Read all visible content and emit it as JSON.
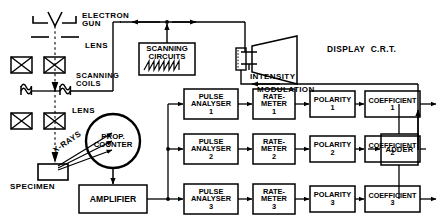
{
  "diagram": {
    "column_labels": {
      "electron_gun": "ELECTRON\nGUN",
      "lens_top": "LENS",
      "scanning_coils": "SCANNING\nCOILS",
      "lens_bottom": "LENS",
      "x_rays": "X-RAYS",
      "specimen": "SPECIMEN",
      "prop_counter": "PROP.\nCOUNTER",
      "display_crt": "DISPLAY  C.R.T.",
      "intensity": "INTENSITY",
      "modulation": "MODULATION"
    },
    "boxes": {
      "scanning_circuits": "SCANNING\nCIRCUITS",
      "amplifier": "AMPLIFIER",
      "adder": "ADDER"
    },
    "chain_headers": [
      "PULSE\nANALYSER",
      "RATE-\nMETER",
      "POLARITY",
      "COEFFICIENT"
    ],
    "channels": [
      {
        "index": "1",
        "pulse_analyser": "PULSE\nANALYSER",
        "pulse_analyser_num": "1",
        "rate_meter": "RATE-\nMETER",
        "rate_meter_num": "1",
        "polarity": "POLARITY",
        "polarity_num": "1",
        "coefficient": "COEFFICIENT",
        "coefficient_num": "1"
      },
      {
        "index": "2",
        "pulse_analyser": "PULSE\nANALYSER",
        "pulse_analyser_num": "2",
        "rate_meter": "RATE-\nMETER",
        "rate_meter_num": "2",
        "polarity": "POLARITY",
        "polarity_num": "2",
        "coefficient": "COEFFICIENT",
        "coefficient_num": "2"
      },
      {
        "index": "3",
        "pulse_analyser": "PULSE\nANALYSER",
        "pulse_analyser_num": "3",
        "rate_meter": "RATE-\nMETER",
        "rate_meter_num": "3",
        "polarity": "POLARITY",
        "polarity_num": "3",
        "coefficient": "COEFFICIENT",
        "coefficient_num": "3"
      }
    ],
    "colors": {
      "ink": "#000000",
      "paper": "#ffffff"
    }
  }
}
